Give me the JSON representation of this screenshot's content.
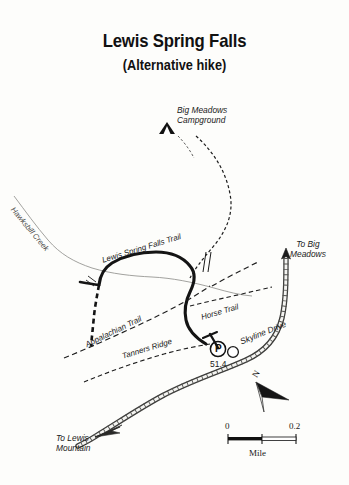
{
  "title": {
    "main": "Lewis Spring Falls",
    "subtitle": "(Alternative hike)"
  },
  "features": {
    "campground": {
      "icon": "tent-icon",
      "line1": "Big Meadows",
      "line2": "Campground"
    },
    "creek": {
      "label": "Hawksbill Creek"
    },
    "trails": [
      {
        "name": "Lewis Spring Falls Trail",
        "style": "thick-solid"
      },
      {
        "name": "Appalachian Trail",
        "style": "dashed"
      },
      {
        "name": "Horse Trail",
        "style": "dashed"
      },
      {
        "name": "Tanners Ridge",
        "style": "dashed"
      }
    ],
    "road": {
      "label": "Skyline Drive",
      "milepost": "51.4"
    },
    "parking": {
      "symbol": "P"
    },
    "directions": [
      {
        "line1": "To Big",
        "line2": "Meadows"
      },
      {
        "line1": "To Lewis",
        "line2": "Mountain"
      }
    ]
  },
  "compass": {
    "north_letter": "N"
  },
  "scale": {
    "min": "0",
    "max": "0.2",
    "unit": "Mile"
  },
  "colors": {
    "background": "#fdfdfb",
    "ink": "#1a1a1a",
    "trail": "#151515",
    "creek": "#7a7a78",
    "road": "#4a4a48"
  }
}
